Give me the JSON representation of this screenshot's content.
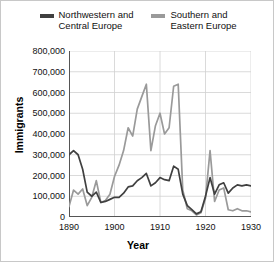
{
  "legend": {
    "items": [
      {
        "label": "Northwestern and\nCentral Europe",
        "color": "#404040",
        "name": "series-northwestern-central-europe"
      },
      {
        "label": "Southern and\nEastern Europe",
        "color": "#9a9a9a",
        "name": "series-southern-eastern-europe"
      }
    ]
  },
  "axes": {
    "ylabel": "Immigrants",
    "xlabel": "Year",
    "yticks": [
      "800,000",
      "700,000",
      "600,000",
      "500,000",
      "400,000",
      "300,000",
      "200,000",
      "100,000",
      "0"
    ],
    "xticks": [
      "1890",
      "1900",
      "1910",
      "1920",
      "1930"
    ]
  },
  "chart_data": {
    "type": "line",
    "title": "",
    "xlabel": "Year",
    "ylabel": "Immigrants",
    "xlim": [
      1890,
      1930
    ],
    "ylim": [
      0,
      800000
    ],
    "grid": true,
    "legend_position": "top-center",
    "x": [
      1890,
      1891,
      1892,
      1893,
      1894,
      1895,
      1896,
      1897,
      1898,
      1899,
      1900,
      1901,
      1902,
      1903,
      1904,
      1905,
      1906,
      1907,
      1908,
      1909,
      1910,
      1911,
      1912,
      1913,
      1914,
      1915,
      1916,
      1917,
      1918,
      1919,
      1920,
      1921,
      1922,
      1923,
      1924,
      1925,
      1926,
      1927,
      1928,
      1929,
      1930
    ],
    "series": [
      {
        "name": "Northwestern and Central Europe",
        "color": "#404040",
        "values": [
          300000,
          320000,
          300000,
          230000,
          120000,
          100000,
          120000,
          70000,
          75000,
          85000,
          95000,
          95000,
          115000,
          145000,
          150000,
          175000,
          190000,
          210000,
          150000,
          165000,
          190000,
          180000,
          175000,
          245000,
          230000,
          110000,
          55000,
          35000,
          15000,
          25000,
          100000,
          190000,
          110000,
          155000,
          165000,
          115000,
          140000,
          155000,
          150000,
          155000,
          150000
        ]
      },
      {
        "name": "Southern and Eastern Europe",
        "color": "#9a9a9a",
        "values": [
          50000,
          130000,
          110000,
          135000,
          55000,
          95000,
          175000,
          70000,
          80000,
          110000,
          195000,
          250000,
          320000,
          430000,
          390000,
          520000,
          580000,
          640000,
          320000,
          440000,
          500000,
          400000,
          430000,
          630000,
          640000,
          130000,
          40000,
          30000,
          10000,
          20000,
          90000,
          320000,
          75000,
          130000,
          140000,
          35000,
          30000,
          40000,
          30000,
          30000,
          25000
        ]
      }
    ],
    "annotations": []
  }
}
